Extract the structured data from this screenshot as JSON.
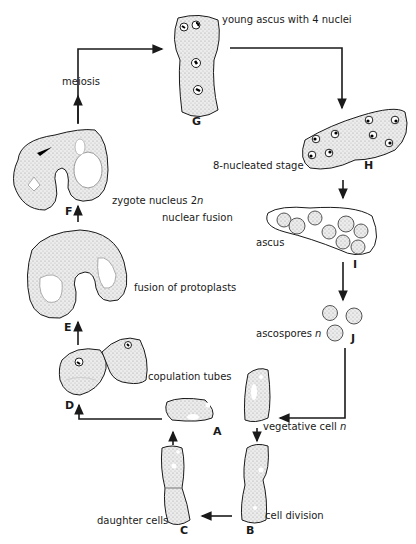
{
  "stages": {
    "A": {
      "letter": "A"
    },
    "B": {
      "letter": "B",
      "label": "cell division"
    },
    "C": {
      "letter": "C",
      "label": "daughter cells"
    },
    "D": {
      "letter": "D",
      "label": "copulation tubes"
    },
    "E": {
      "letter": "E",
      "label": "fusion of protoplasts"
    },
    "F": {
      "letter": "F",
      "label": "zygote nucleus 2",
      "label_suffix": "n",
      "label2": "nuclear fusion"
    },
    "G": {
      "letter": "G",
      "label": "young ascus with 4 nuclei"
    },
    "H": {
      "letter": "H",
      "label": "8-nucleated stage"
    },
    "I": {
      "letter": "I",
      "label": "ascus"
    },
    "J": {
      "letter": "J",
      "label": "ascospores",
      "label_suffix": "n"
    }
  },
  "labels": {
    "meiosis": "meiosis",
    "vegetative_cell": "vegetative cell",
    "vegetative_suffix": "n"
  },
  "colors": {
    "ink": "#1a1a1a",
    "cell_fill": "#e4e4e4",
    "background": "#ffffff"
  }
}
